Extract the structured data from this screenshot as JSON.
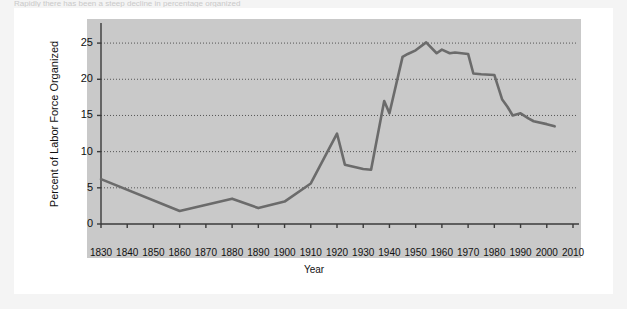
{
  "page": {
    "top_text_sliver": "Rapidly there has been a steep decline in percentage organized"
  },
  "figure": {
    "xlabel": "Year",
    "ylabel": "Percent of Labor Force Organized"
  },
  "chart_data": {
    "type": "line",
    "title": "",
    "xlabel": "Year",
    "ylabel": "Percent of Labor Force Organized",
    "xlim": [
      1830,
      2010
    ],
    "ylim": [
      0,
      27.5
    ],
    "yticks": [
      0,
      5,
      10,
      15,
      20,
      25
    ],
    "xticks": [
      1830,
      1840,
      1850,
      1860,
      1870,
      1880,
      1890,
      1900,
      1910,
      1920,
      1930,
      1940,
      1950,
      1960,
      1970,
      1980,
      1990,
      2000,
      2010
    ],
    "grid": "horizontal-dotted",
    "legend": "none",
    "line_color": "#6b6b6b",
    "panel_color": "#c9c9c9",
    "series": [
      {
        "name": "Percent of Labor Force Organized",
        "x": [
          1830,
          1860,
          1880,
          1890,
          1900,
          1910,
          1920,
          1923,
          1930,
          1933,
          1938,
          1940,
          1945,
          1947,
          1950,
          1954,
          1958,
          1960,
          1963,
          1965,
          1970,
          1972,
          1975,
          1980,
          1983,
          1985,
          1987,
          1990,
          1993,
          1995,
          2000,
          2003
        ],
        "y": [
          6.2,
          1.8,
          3.5,
          2.2,
          3.1,
          5.6,
          12.5,
          8.2,
          7.6,
          7.5,
          17.0,
          15.3,
          23.1,
          23.5,
          24.0,
          25.1,
          23.6,
          24.1,
          23.6,
          23.7,
          23.5,
          20.8,
          20.7,
          20.6,
          17.2,
          16.2,
          15.0,
          15.3,
          14.6,
          14.2,
          13.8,
          13.5
        ]
      }
    ]
  }
}
